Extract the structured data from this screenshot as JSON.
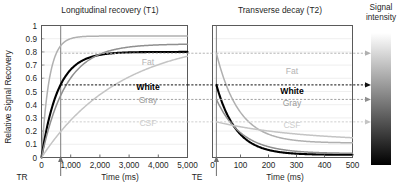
{
  "figure": {
    "panels": [
      {
        "id": "t1",
        "title": "Longitudinal recovery (T1)",
        "xlabel": "Time (ms)",
        "ylabel": "Relative Signal Recovery",
        "marker_label": "TR",
        "marker_value_ms": 700,
        "xticks": [
          "0",
          "1,000",
          "2,000",
          "3,000",
          "4,000",
          "5,000"
        ],
        "xtick_values": [
          0,
          1000,
          2000,
          3000,
          4000,
          5000
        ],
        "yticks": [
          "0",
          "0.1",
          "0.2",
          "0.3",
          "0.4",
          "0.5",
          "0.6",
          "0.7",
          "0.8",
          "0.9",
          "1"
        ],
        "ytick_values": [
          0,
          0.1,
          0.2,
          0.3,
          0.4,
          0.5,
          0.6,
          0.7,
          0.8,
          0.9,
          1
        ]
      },
      {
        "id": "t2",
        "title": "Transverse decay (T2)",
        "xlabel": "Time (ms)",
        "marker_label": "TE",
        "marker_value_ms": 14,
        "xticks": [
          "0",
          "100",
          "200",
          "300",
          "400",
          "500"
        ],
        "xtick_values": [
          0,
          100,
          200,
          300,
          400,
          500
        ]
      }
    ],
    "colorbar": {
      "title_line1": "Signal",
      "title_line2": "intensity",
      "top_color": "#ffffff",
      "bottom_color": "#000000"
    },
    "tissues": [
      {
        "name": "Fat",
        "color": "#b0b0b0",
        "bold": false,
        "t1_ms": 260,
        "t1_plateau": 0.92,
        "signal_at_tr": 0.79,
        "t2_ms": 80,
        "t2_floor": 0.11
      },
      {
        "name": "White",
        "color": "#000000",
        "bold": true,
        "t1_ms": 560,
        "t1_plateau": 0.8,
        "signal_at_tr": 0.55,
        "t2_ms": 70,
        "t2_floor": 0.02
      },
      {
        "name": "Gray",
        "color": "#8f8f8f",
        "bold": false,
        "t1_ms": 830,
        "t1_plateau": 0.86,
        "signal_at_tr": 0.44,
        "t2_ms": 90,
        "t2_floor": 0.03
      },
      {
        "name": "CSF",
        "color": "#c4c4c4",
        "bold": false,
        "t1_ms": 2700,
        "t1_plateau": 0.91,
        "signal_at_tr": 0.27,
        "t2_ms": 300,
        "t2_floor": 0.12
      }
    ]
  },
  "chart_data": {
    "type": "line",
    "panels": [
      {
        "name": "Longitudinal recovery (T1)",
        "xlabel": "Time (ms)",
        "ylabel": "Relative Signal Recovery",
        "xlim": [
          0,
          5000
        ],
        "ylim": [
          0,
          1
        ],
        "grid": true,
        "vertical_marker": {
          "label": "TR",
          "x": 700
        },
        "series": [
          {
            "name": "Fat",
            "color": "#b0b0b0",
            "model": "1-exp(-t/T1)",
            "T1_ms": 260,
            "amplitude": 0.92,
            "value_at_TR": 0.79
          },
          {
            "name": "White",
            "color": "#000000",
            "model": "1-exp(-t/T1)",
            "T1_ms": 560,
            "amplitude": 0.8,
            "value_at_TR": 0.55
          },
          {
            "name": "Gray",
            "color": "#8f8f8f",
            "model": "1-exp(-t/T1)",
            "T1_ms": 830,
            "amplitude": 0.86,
            "value_at_TR": 0.44
          },
          {
            "name": "CSF",
            "color": "#c4c4c4",
            "model": "1-exp(-t/T1)",
            "T1_ms": 2700,
            "amplitude": 0.91,
            "value_at_TR": 0.27
          }
        ]
      },
      {
        "name": "Transverse decay (T2)",
        "xlabel": "Time (ms)",
        "ylabel": "",
        "xlim": [
          0,
          500
        ],
        "ylim": [
          0,
          1
        ],
        "grid": true,
        "vertical_marker": {
          "label": "TE",
          "x": 14
        },
        "series": [
          {
            "name": "Fat",
            "color": "#b0b0b0",
            "model": "A*exp(-t/T2)",
            "T2_ms": 80,
            "start": 0.79,
            "floor": 0.11
          },
          {
            "name": "White",
            "color": "#000000",
            "model": "A*exp(-t/T2)",
            "T2_ms": 70,
            "start": 0.55,
            "floor": 0.02
          },
          {
            "name": "Gray",
            "color": "#8f8f8f",
            "model": "A*exp(-t/T2)",
            "T2_ms": 90,
            "start": 0.44,
            "floor": 0.03
          },
          {
            "name": "CSF",
            "color": "#c4c4c4",
            "model": "A*exp(-t/T2)",
            "T2_ms": 300,
            "start": 0.27,
            "floor": 0.12
          }
        ]
      }
    ],
    "legend_position": "inline-annotations",
    "annotations": [
      "Fat",
      "White",
      "Gray",
      "CSF"
    ],
    "colorbar": {
      "label": "Signal intensity",
      "from": "white",
      "to": "black"
    }
  }
}
